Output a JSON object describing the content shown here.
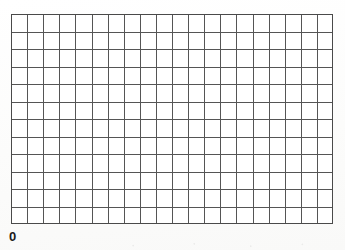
{
  "chart_data": {
    "type": "table",
    "title": "",
    "subtitle": "",
    "xlabel": "",
    "ylabel": "",
    "grid": true,
    "legend": null,
    "annotations": [],
    "columns": 20,
    "rows": 12,
    "cells": [],
    "series": [],
    "categories": [],
    "values": [],
    "axis": {
      "origin_label": "0",
      "x_ticks": [],
      "y_ticks": []
    }
  },
  "figure": {
    "plot": {
      "left": 11,
      "top": 14,
      "width": 322,
      "height": 210,
      "columns": 20,
      "rows": 12,
      "line_color": "#555555",
      "border_color": "#4a4a4a",
      "cell_fill": "#ffffff",
      "line_width": 1
    },
    "origin": {
      "label": "0",
      "left": 9,
      "top": 230,
      "font_size": 13
    },
    "background_color": "#fdfdfc"
  }
}
